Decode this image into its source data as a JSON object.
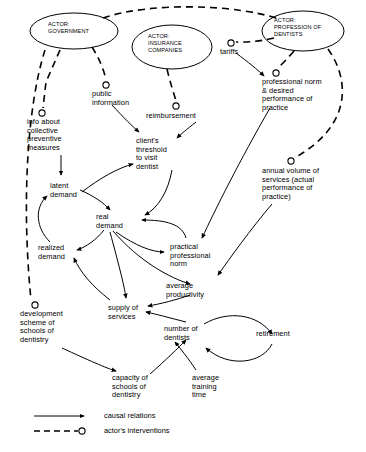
{
  "diagram": {
    "type": "causal-loop-diagram",
    "title": "",
    "actors": [
      {
        "id": "government",
        "label": "ACTOR:\nGOVERNMENT",
        "shape": "ellipse",
        "cx": 74,
        "cy": 31,
        "rx": 44,
        "ry": 18
      },
      {
        "id": "insurance",
        "label": "ACTOR:\nINSURANCE\nCOMPANIES",
        "shape": "ellipse",
        "cx": 172,
        "cy": 47,
        "rx": 40,
        "ry": 22
      },
      {
        "id": "dentists",
        "label": "ACTOR:\nPROFESSION OF\nDENTISTS",
        "shape": "ellipse",
        "cx": 303,
        "cy": 31,
        "rx": 41,
        "ry": 20
      }
    ],
    "interventions": [
      {
        "id": "public-information",
        "label": "public\ninformation",
        "circle_x": 106,
        "circle_y": 85,
        "text_x": 92,
        "text_y": 90
      },
      {
        "id": "info-collective",
        "label": "info about\ncollective\npreventive\nmeasures",
        "circle_x": 42,
        "circle_y": 113,
        "text_x": 27,
        "text_y": 118
      },
      {
        "id": "reimbursement",
        "label": "reimbursement",
        "circle_x": 176,
        "circle_y": 106,
        "text_x": 148,
        "text_y": 112
      },
      {
        "id": "tariffs",
        "label": "tariffs",
        "circle_x": 230,
        "circle_y": 43,
        "text_x": 220,
        "text_y": 48
      },
      {
        "id": "professional-norm-desired",
        "label": "professional norm\n& desired\nperformance of\npractice",
        "circle_x": 276,
        "circle_y": 73,
        "text_x": 262,
        "text_y": 78
      },
      {
        "id": "annual-volume",
        "label": "annual volume of\nservices (actual\nperformance of\npractice)",
        "circle_x": 290,
        "circle_y": 161,
        "text_x": 262,
        "text_y": 167
      },
      {
        "id": "development-scheme",
        "label": "development\nscheme of\nschools of\ndentistry",
        "circle_x": 35,
        "circle_y": 305,
        "text_x": 20,
        "text_y": 310
      }
    ],
    "variables": [
      {
        "id": "clients-threshold",
        "label": "client's\nthreshold\nto visit\ndentist",
        "x": 136,
        "y": 137
      },
      {
        "id": "latent-demand",
        "label": "latent\ndemand",
        "x": 50,
        "y": 182
      },
      {
        "id": "real-demand",
        "label": "real\ndemand",
        "x": 96,
        "y": 213
      },
      {
        "id": "realized-demand",
        "label": "realized\ndemand",
        "x": 38,
        "y": 244
      },
      {
        "id": "practical-professional-norm",
        "label": "practical\nprofessional\nnorm",
        "x": 170,
        "y": 243
      },
      {
        "id": "average-productivity",
        "label": "average\nproductivity",
        "x": 166,
        "y": 282
      },
      {
        "id": "supply-of-services",
        "label": "supply of\nservices",
        "x": 108,
        "y": 304
      },
      {
        "id": "number-of-dentists",
        "label": "number of\ndentists",
        "x": 164,
        "y": 325
      },
      {
        "id": "retirement",
        "label": "retirement",
        "x": 256,
        "y": 330
      },
      {
        "id": "capacity-of-schools",
        "label": "capacity of\nschools of\ndentistry",
        "x": 112,
        "y": 374
      },
      {
        "id": "average-training-time",
        "label": "average\ntraining\ntime",
        "x": 192,
        "y": 374
      }
    ],
    "legend": {
      "items": [
        {
          "id": "causal-relations",
          "label": "causal relations",
          "style": "solid-arrow"
        },
        {
          "id": "actor-interventions",
          "label": "actor's interventions",
          "style": "dashed-circle"
        }
      ]
    },
    "colors": {
      "stroke": "#000000",
      "background": "#ffffff"
    }
  }
}
